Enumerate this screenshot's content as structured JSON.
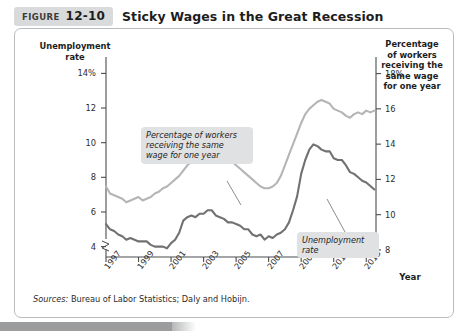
{
  "header": {
    "tag_word": "FIGURE",
    "tag_number": "12-10",
    "title": "Sticky Wages in the Great Recession"
  },
  "axes": {
    "y_left_title": "Unemployment\nrate",
    "y_right_title": "Percentage\nof workers\nreceiving the\nsame wage\nfor one year",
    "x_title": "Year"
  },
  "callouts": {
    "wage": "Percentage of workers\nreceiving the same\nwage for one year",
    "unemployment": "Unemployment\nrate"
  },
  "source": {
    "label": "Sources:",
    "text": " Bureau of Labor Statistics; Daly and Hobijn."
  },
  "ticks": {
    "left": [
      "14%",
      "12",
      "10",
      "8",
      "6",
      "4"
    ],
    "right": [
      "18%",
      "16",
      "14",
      "12",
      "10",
      "8"
    ],
    "x": [
      "1997",
      "1999",
      "2001",
      "2003",
      "2005",
      "2007",
      "2009",
      "2011",
      "2013"
    ]
  },
  "colors": {
    "unemployment_line": "#6f7173",
    "wage_line": "#b3b5b7",
    "axis": "#4a4c4e",
    "panel_border": "#b9bcbe",
    "callout_bg": "#e0e1e2",
    "tag_bg": "#d9dadb"
  },
  "chart_data": {
    "type": "line",
    "title": "Sticky Wages in the Great Recession",
    "xlabel": "Year",
    "ylabel": "Unemployment rate",
    "y2label": "Percentage of workers receiving the same wage for one year",
    "xlim": [
      1997,
      2013.6
    ],
    "ylim": [
      3.4,
      14.6
    ],
    "y2lim": [
      7.6,
      18.6
    ],
    "ytick_values": [
      14,
      12,
      10,
      8,
      6,
      4
    ],
    "ytick_labels": [
      "14%",
      "12",
      "10",
      "8",
      "6",
      "4"
    ],
    "y2tick_values": [
      18,
      16,
      14,
      12,
      10,
      8
    ],
    "y2tick_labels": [
      "18%",
      "16",
      "14",
      "12",
      "10",
      "8"
    ],
    "xtick_values": [
      1997,
      1999,
      2001,
      2003,
      2005,
      2007,
      2009,
      2011,
      2013
    ],
    "xtick_labels": [
      "1997",
      "1999",
      "2001",
      "2003",
      "2005",
      "2007",
      "2009",
      "2011",
      "2013"
    ],
    "grid": false,
    "legend": "annotations-inline",
    "axis_break_y": true,
    "axis_break_y2": true,
    "series": [
      {
        "name": "Unemployment rate",
        "axis": "left",
        "color": "#6f7173",
        "x": [
          1997.0,
          1997.25,
          1997.5,
          1997.75,
          1998.0,
          1998.25,
          1998.5,
          1998.75,
          1999.0,
          1999.25,
          1999.5,
          1999.75,
          2000.0,
          2000.25,
          2000.5,
          2000.75,
          2001.0,
          2001.25,
          2001.5,
          2001.75,
          2002.0,
          2002.25,
          2002.5,
          2002.75,
          2003.0,
          2003.25,
          2003.5,
          2003.75,
          2004.0,
          2004.25,
          2004.5,
          2004.75,
          2005.0,
          2005.25,
          2005.5,
          2005.75,
          2006.0,
          2006.25,
          2006.5,
          2006.75,
          2007.0,
          2007.25,
          2007.5,
          2007.75,
          2008.0,
          2008.25,
          2008.5,
          2008.75,
          2009.0,
          2009.25,
          2009.5,
          2009.75,
          2010.0,
          2010.25,
          2010.5,
          2010.75,
          2011.0,
          2011.25,
          2011.5,
          2011.75,
          2012.0,
          2012.25,
          2012.5,
          2012.75,
          2013.0,
          2013.25,
          2013.5
        ],
        "y": [
          5.3,
          5.0,
          4.9,
          4.7,
          4.6,
          4.4,
          4.5,
          4.4,
          4.3,
          4.3,
          4.3,
          4.1,
          4.0,
          4.0,
          4.0,
          3.9,
          4.2,
          4.4,
          4.8,
          5.5,
          5.7,
          5.8,
          5.7,
          5.9,
          5.9,
          6.1,
          6.1,
          5.8,
          5.7,
          5.6,
          5.4,
          5.4,
          5.3,
          5.2,
          5.0,
          5.0,
          4.7,
          4.6,
          4.7,
          4.4,
          4.6,
          4.5,
          4.7,
          4.8,
          5.0,
          5.4,
          6.1,
          6.9,
          8.2,
          9.0,
          9.6,
          9.9,
          9.8,
          9.6,
          9.5,
          9.5,
          9.1,
          9.0,
          9.0,
          8.7,
          8.3,
          8.2,
          8.0,
          7.8,
          7.7,
          7.5,
          7.3
        ],
        "note": "Rises sharply from ~4.6 in 2007 to a peak of ~10.0 in late 2009, then declines to ~7.3 by 2013"
      },
      {
        "name": "Percentage of workers receiving the same wage for one year",
        "axis": "right",
        "color": "#b3b5b7",
        "x": [
          1997.0,
          1997.25,
          1997.5,
          1997.75,
          1998.0,
          1998.25,
          1998.5,
          1998.75,
          1999.0,
          1999.25,
          1999.5,
          1999.75,
          2000.0,
          2000.25,
          2000.5,
          2000.75,
          2001.0,
          2001.25,
          2001.5,
          2001.75,
          2002.0,
          2002.25,
          2002.5,
          2002.75,
          2003.0,
          2003.25,
          2003.5,
          2003.75,
          2004.0,
          2004.25,
          2004.5,
          2004.75,
          2005.0,
          2005.25,
          2005.5,
          2005.75,
          2006.0,
          2006.25,
          2006.5,
          2006.75,
          2007.0,
          2007.25,
          2007.5,
          2007.75,
          2008.0,
          2008.25,
          2008.5,
          2008.75,
          2009.0,
          2009.25,
          2009.5,
          2009.75,
          2010.0,
          2010.25,
          2010.5,
          2010.75,
          2011.0,
          2011.25,
          2011.5,
          2011.75,
          2012.0,
          2012.25,
          2012.5,
          2012.75,
          2013.0,
          2013.25,
          2013.5
        ],
        "y": [
          11.6,
          11.2,
          11.1,
          11.0,
          10.9,
          10.7,
          10.8,
          10.9,
          11.0,
          10.8,
          10.9,
          11.0,
          11.2,
          11.3,
          11.5,
          11.6,
          11.8,
          12.0,
          12.2,
          12.5,
          12.8,
          13.0,
          13.2,
          13.4,
          13.6,
          13.8,
          13.6,
          13.5,
          13.4,
          13.3,
          13.1,
          13.0,
          12.8,
          12.6,
          12.4,
          12.2,
          12.0,
          11.8,
          11.6,
          11.5,
          11.5,
          11.6,
          11.8,
          12.2,
          12.8,
          13.4,
          14.0,
          14.6,
          15.2,
          15.7,
          16.0,
          16.2,
          16.4,
          16.5,
          16.4,
          16.3,
          16.0,
          15.9,
          15.8,
          15.6,
          15.5,
          15.7,
          15.8,
          15.7,
          15.9,
          15.8,
          15.9
        ],
        "note": "Rises from ~11 in 1997 to ~13.8 in 2003, dips to ~11.5 in 2007, then jumps to peak ~16.5 in 2010 and stays near 16 through 2013"
      }
    ]
  }
}
